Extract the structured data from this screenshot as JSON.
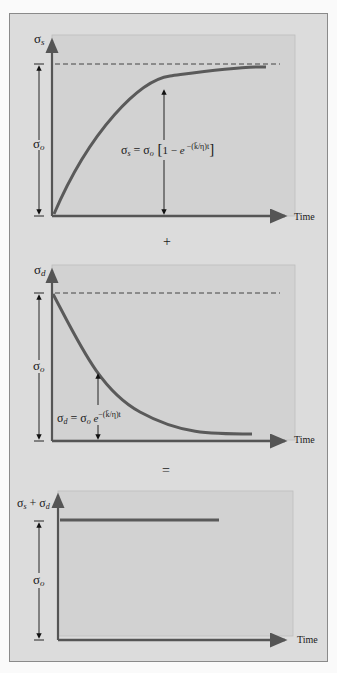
{
  "figure": {
    "panels": [
      {
        "id": "spring",
        "y_axis_label": "σ",
        "y_axis_sub": "s",
        "x_axis_label": "Time",
        "magnitude_label": "σ",
        "magnitude_sub": "o",
        "equation": "σs = σo [1 − e−(k̄/η)t]",
        "curve": "rising exponential approaching σo"
      },
      {
        "id": "dashpot",
        "y_axis_label": "σ",
        "y_axis_sub": "d",
        "x_axis_label": "Time",
        "magnitude_label": "σ",
        "magnitude_sub": "o",
        "equation": "σd = σo e−(k̄/η)t",
        "curve": "decaying exponential from σo"
      },
      {
        "id": "sum",
        "y_axis_label": "σs + σd",
        "x_axis_label": "Time",
        "magnitude_label": "σ",
        "magnitude_sub": "o",
        "curve": "constant at σo"
      }
    ],
    "operators": [
      "+",
      "="
    ],
    "colors": {
      "background": "#dcdcdc",
      "plot_area": "#d2d2d2",
      "curve": "#5a5a5a",
      "axis": "#555555",
      "text": "#1a1a1a"
    }
  }
}
